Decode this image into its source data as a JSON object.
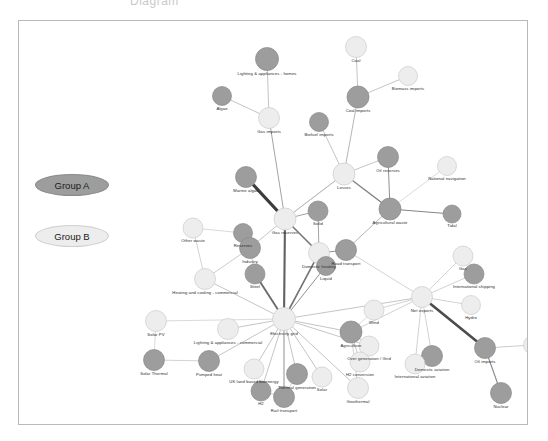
{
  "page": {
    "cut_off_title": "Diagram",
    "frame_color": "#b9b9b9",
    "background": "#ffffff"
  },
  "legend": {
    "items": [
      {
        "label": "Group A",
        "color": "#9d9d9d",
        "border": "#8a8a8a"
      },
      {
        "label": "Group B",
        "color": "#ededed",
        "border": "#cfcfcf"
      }
    ]
  },
  "chart_data": {
    "type": "scatter",
    "title": "",
    "xlabel": "",
    "ylabel": "",
    "grid": false,
    "legend_position": "left",
    "nodes": [
      {
        "id": "lighting-appliances-homes",
        "label": "Lighting & appliances - homes",
        "x": 248,
        "y": 38,
        "r": 11.5,
        "group": "A"
      },
      {
        "id": "coal",
        "label": "Coal",
        "x": 337,
        "y": 26,
        "r": 10.5,
        "group": "B"
      },
      {
        "id": "biomass-imports",
        "label": "Biomass imports",
        "x": 389,
        "y": 55,
        "r": 9.5,
        "group": "B"
      },
      {
        "id": "algae",
        "label": "Algae",
        "x": 203,
        "y": 75,
        "r": 9.5,
        "group": "A"
      },
      {
        "id": "gas-imports",
        "label": "Gas imports",
        "x": 250,
        "y": 97,
        "r": 10.5,
        "group": "B"
      },
      {
        "id": "coal-imports",
        "label": "Coal imports",
        "x": 339,
        "y": 76,
        "r": 11.0,
        "group": "A"
      },
      {
        "id": "biofuel-imports",
        "label": "Biofuel imports",
        "x": 300,
        "y": 101,
        "r": 9.5,
        "group": "A"
      },
      {
        "id": "oil-reserves",
        "label": "Oil reserves",
        "x": 369,
        "y": 136,
        "r": 10.5,
        "group": "A"
      },
      {
        "id": "national-navigation",
        "label": "National navigation",
        "x": 428,
        "y": 145,
        "r": 9.5,
        "group": "B"
      },
      {
        "id": "losses",
        "label": "Losses",
        "x": 325,
        "y": 153,
        "r": 11.0,
        "group": "B"
      },
      {
        "id": "marine-algae",
        "label": "Marine algae",
        "x": 227,
        "y": 156,
        "r": 10.5,
        "group": "A"
      },
      {
        "id": "agricultural-waste",
        "label": "Agricultural waste",
        "x": 371,
        "y": 188,
        "r": 11.0,
        "group": "A"
      },
      {
        "id": "tidal",
        "label": "Tidal",
        "x": 433,
        "y": 193,
        "r": 9.0,
        "group": "A"
      },
      {
        "id": "solid",
        "label": "Solid",
        "x": 299,
        "y": 190,
        "r": 10.0,
        "group": "A"
      },
      {
        "id": "gas-reserves",
        "label": "Gas reserves",
        "x": 266,
        "y": 198,
        "r": 11.0,
        "group": "B"
      },
      {
        "id": "other-waste",
        "label": "Other waste",
        "x": 174,
        "y": 207,
        "r": 10.0,
        "group": "B"
      },
      {
        "id": "reserves",
        "label": "Reserves",
        "x": 224,
        "y": 212,
        "r": 9.5,
        "group": "A"
      },
      {
        "id": "industry",
        "label": "Industry",
        "x": 231,
        "y": 227,
        "r": 10.5,
        "group": "A"
      },
      {
        "id": "domestic-heating",
        "label": "Domestic heating",
        "x": 300,
        "y": 232,
        "r": 10.5,
        "group": "B"
      },
      {
        "id": "road-transport",
        "label": "Road transport",
        "x": 327,
        "y": 229,
        "r": 10.5,
        "group": "A"
      },
      {
        "id": "liquid",
        "label": "Liquid",
        "x": 307,
        "y": 245,
        "r": 9.5,
        "group": "A"
      },
      {
        "id": "gas",
        "label": "Gas",
        "x": 444,
        "y": 235,
        "r": 10.0,
        "group": "B"
      },
      {
        "id": "international-shipping",
        "label": "International shipping",
        "x": 455,
        "y": 253,
        "r": 10.0,
        "group": "A"
      },
      {
        "id": "heating-cooling-commercial",
        "label": "Heating and cooling - commercial",
        "x": 186,
        "y": 258,
        "r": 10.5,
        "group": "B"
      },
      {
        "id": "steel",
        "label": "Steel",
        "x": 236,
        "y": 253,
        "r": 10.0,
        "group": "A"
      },
      {
        "id": "net-exports",
        "label": "Net exports",
        "x": 403,
        "y": 276,
        "r": 10.5,
        "group": "B"
      },
      {
        "id": "hydro",
        "label": "Hydro",
        "x": 452,
        "y": 284,
        "r": 9.5,
        "group": "B"
      },
      {
        "id": "wind",
        "label": "Wind",
        "x": 355,
        "y": 289,
        "r": 10.0,
        "group": "B"
      },
      {
        "id": "electricity-grid",
        "label": "Electricity grid",
        "x": 265,
        "y": 298,
        "r": 11.5,
        "group": "B"
      },
      {
        "id": "solar-pv",
        "label": "Solar PV",
        "x": 137,
        "y": 300,
        "r": 10.5,
        "group": "B"
      },
      {
        "id": "lighting-appliances-commercial",
        "label": "Lighting & appliances - commercial",
        "x": 209,
        "y": 308,
        "r": 10.5,
        "group": "B"
      },
      {
        "id": "agriculture",
        "label": "Agriculture",
        "x": 332,
        "y": 311,
        "r": 11.0,
        "group": "A"
      },
      {
        "id": "over-generation-grid",
        "label": "Over generation / Grid",
        "x": 350,
        "y": 325,
        "r": 10.0,
        "group": "B"
      },
      {
        "id": "domestic-aviation",
        "label": "Domestic aviation",
        "x": 413,
        "y": 335,
        "r": 10.5,
        "group": "A"
      },
      {
        "id": "oil-imports",
        "label": "Oil imports",
        "x": 466,
        "y": 327,
        "r": 10.5,
        "group": "A"
      },
      {
        "id": "oil",
        "label": "Oil",
        "x": 514,
        "y": 324,
        "r": 9.5,
        "group": "B"
      },
      {
        "id": "international-aviation",
        "label": "International aviation",
        "x": 396,
        "y": 343,
        "r": 10.0,
        "group": "B"
      },
      {
        "id": "solar-thermal",
        "label": "Solar Thermal",
        "x": 135,
        "y": 339,
        "r": 10.5,
        "group": "A"
      },
      {
        "id": "pumped-heat",
        "label": "Pumped heat",
        "x": 190,
        "y": 340,
        "r": 10.5,
        "group": "A"
      },
      {
        "id": "uk-land-based-bioenergy",
        "label": "UK land based bioenergy",
        "x": 235,
        "y": 348,
        "r": 10.0,
        "group": "B"
      },
      {
        "id": "thermal-generation",
        "label": "Thermal generation",
        "x": 278,
        "y": 353,
        "r": 10.5,
        "group": "A"
      },
      {
        "id": "solar",
        "label": "Solar",
        "x": 303,
        "y": 356,
        "r": 10.0,
        "group": "B"
      },
      {
        "id": "h2-conversion",
        "label": "H2 conversion",
        "x": 341,
        "y": 341,
        "r": 10.0,
        "group": "B"
      },
      {
        "id": "geothermal",
        "label": "Geothermal",
        "x": 339,
        "y": 367,
        "r": 10.5,
        "group": "B"
      },
      {
        "id": "h2",
        "label": "H2",
        "x": 242,
        "y": 370,
        "r": 10.0,
        "group": "A"
      },
      {
        "id": "rail-transport",
        "label": "Rail transport",
        "x": 265,
        "y": 376,
        "r": 10.5,
        "group": "A"
      },
      {
        "id": "nuclear",
        "label": "Nuclear",
        "x": 482,
        "y": 372,
        "r": 10.5,
        "group": "A"
      }
    ],
    "edges": [
      {
        "source": "lighting-appliances-homes",
        "target": "gas-imports",
        "weight": 1
      },
      {
        "source": "algae",
        "target": "gas-imports",
        "weight": 1
      },
      {
        "source": "coal",
        "target": "coal-imports",
        "weight": 1
      },
      {
        "source": "biomass-imports",
        "target": "coal-imports",
        "weight": 1
      },
      {
        "source": "coal-imports",
        "target": "losses",
        "weight": 1.2
      },
      {
        "source": "biofuel-imports",
        "target": "losses",
        "weight": 1
      },
      {
        "source": "gas-imports",
        "target": "gas-reserves",
        "weight": 1.4
      },
      {
        "source": "losses",
        "target": "oil-reserves",
        "weight": 1
      },
      {
        "source": "losses",
        "target": "agricultural-waste",
        "weight": 2.2
      },
      {
        "source": "oil-reserves",
        "target": "agricultural-waste",
        "weight": 1.6
      },
      {
        "source": "national-navigation",
        "target": "agricultural-waste",
        "weight": 0.7
      },
      {
        "source": "agricultural-waste",
        "target": "tidal",
        "weight": 2.0
      },
      {
        "source": "marine-algae",
        "target": "gas-reserves",
        "weight": 5.0
      },
      {
        "source": "gas-reserves",
        "target": "solid",
        "weight": 1.4
      },
      {
        "source": "solid",
        "target": "domestic-heating",
        "weight": 1.4
      },
      {
        "source": "gas-reserves",
        "target": "domestic-heating",
        "weight": 2.6
      },
      {
        "source": "domestic-heating",
        "target": "road-transport",
        "weight": 1.6
      },
      {
        "source": "domestic-heating",
        "target": "liquid",
        "weight": 1.2
      },
      {
        "source": "other-waste",
        "target": "heating-cooling-commercial",
        "weight": 0.8
      },
      {
        "source": "reserves",
        "target": "industry",
        "weight": 0.9
      },
      {
        "source": "industry",
        "target": "heating-cooling-commercial",
        "weight": 0.9
      },
      {
        "source": "industry",
        "target": "gas-reserves",
        "weight": 1.0
      },
      {
        "source": "heating-cooling-commercial",
        "target": "electricity-grid",
        "weight": 1.0
      },
      {
        "source": "steel",
        "target": "electricity-grid",
        "weight": 3.0
      },
      {
        "source": "gas-reserves",
        "target": "electricity-grid",
        "weight": 3.4
      },
      {
        "source": "domestic-heating",
        "target": "electricity-grid",
        "weight": 2.6
      },
      {
        "source": "liquid",
        "target": "electricity-grid",
        "weight": 1.6
      },
      {
        "source": "electricity-grid",
        "target": "solar-pv",
        "weight": 0.7
      },
      {
        "source": "electricity-grid",
        "target": "lighting-appliances-commercial",
        "weight": 1.0
      },
      {
        "source": "electricity-grid",
        "target": "pumped-heat",
        "weight": 1.0
      },
      {
        "source": "electricity-grid",
        "target": "uk-land-based-bioenergy",
        "weight": 1.0
      },
      {
        "source": "electricity-grid",
        "target": "h2",
        "weight": 1.0
      },
      {
        "source": "electricity-grid",
        "target": "rail-transport",
        "weight": 1.6
      },
      {
        "source": "electricity-grid",
        "target": "thermal-generation",
        "weight": 1.0
      },
      {
        "source": "electricity-grid",
        "target": "solar",
        "weight": 1.0
      },
      {
        "source": "electricity-grid",
        "target": "agriculture",
        "weight": 1.0
      },
      {
        "source": "electricity-grid",
        "target": "over-generation-grid",
        "weight": 1.0
      },
      {
        "source": "electricity-grid",
        "target": "geothermal",
        "weight": 1.0
      },
      {
        "source": "electricity-grid",
        "target": "net-exports",
        "weight": 1.0
      },
      {
        "source": "solar-pv",
        "target": "solar-thermal",
        "weight": 0.7
      },
      {
        "source": "solar-thermal",
        "target": "pumped-heat",
        "weight": 0.8
      },
      {
        "source": "agriculture",
        "target": "over-generation-grid",
        "weight": 1.0
      },
      {
        "source": "agriculture",
        "target": "h2-conversion",
        "weight": 1.0
      },
      {
        "source": "agriculture",
        "target": "net-exports",
        "weight": 0.8
      },
      {
        "source": "net-exports",
        "target": "gas",
        "weight": 0.8
      },
      {
        "source": "net-exports",
        "target": "international-shipping",
        "weight": 0.8
      },
      {
        "source": "net-exports",
        "target": "hydro",
        "weight": 0.8
      },
      {
        "source": "net-exports",
        "target": "wind",
        "weight": 0.8
      },
      {
        "source": "net-exports",
        "target": "domestic-aviation",
        "weight": 0.8
      },
      {
        "source": "net-exports",
        "target": "international-aviation",
        "weight": 0.8
      },
      {
        "source": "net-exports",
        "target": "oil-imports",
        "weight": 4.2
      },
      {
        "source": "oil-imports",
        "target": "oil",
        "weight": 0.9
      },
      {
        "source": "oil-imports",
        "target": "nuclear",
        "weight": 1.8
      },
      {
        "source": "agriculture",
        "target": "geothermal",
        "weight": 0.8
      },
      {
        "source": "losses",
        "target": "gas-reserves",
        "weight": 1.0
      },
      {
        "source": "agricultural-waste",
        "target": "road-transport",
        "weight": 1.2
      },
      {
        "source": "road-transport",
        "target": "net-exports",
        "weight": 0.8
      },
      {
        "source": "industry",
        "target": "steel",
        "weight": 0.9
      },
      {
        "source": "wind",
        "target": "agriculture",
        "weight": 0.7
      },
      {
        "source": "gas-reserves",
        "target": "losses",
        "weight": 0.8
      },
      {
        "source": "reserves",
        "target": "other-waste",
        "weight": 0.7
      },
      {
        "source": "thermal-generation",
        "target": "rail-transport",
        "weight": 0.8
      },
      {
        "source": "h2",
        "target": "rail-transport",
        "weight": 0.8
      }
    ],
    "group_colors": {
      "A": "#9d9d9d",
      "B": "#ededed"
    }
  }
}
